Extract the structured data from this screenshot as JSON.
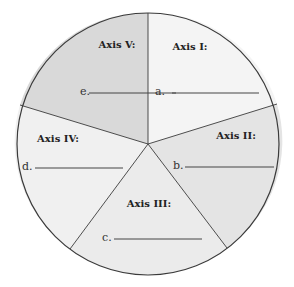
{
  "diagram": {
    "type": "five-axis pie worksheet",
    "center": [
      148,
      144
    ],
    "radius": 131,
    "segments": [
      {
        "id": "axis-1",
        "title": "Axis I:",
        "blank_letter": "a.",
        "fill": "#f4f4f4"
      },
      {
        "id": "axis-2",
        "title": "Axis II:",
        "blank_letter": "b.",
        "fill": "#e4e4e4"
      },
      {
        "id": "axis-3",
        "title": "Axis III:",
        "blank_letter": "c.",
        "fill": "#ebebeb"
      },
      {
        "id": "axis-4",
        "title": "Axis IV:",
        "blank_letter": "d.",
        "fill": "#f0f0f0"
      },
      {
        "id": "axis-5",
        "title": "Axis V:",
        "blank_letter": "e.",
        "fill": "#d9d9d9"
      }
    ],
    "colors": {
      "outline": "#3a3a3a",
      "text": "#222222",
      "background": "#ffffff"
    }
  }
}
